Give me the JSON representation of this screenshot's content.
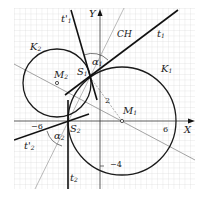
{
  "diagram": {
    "axes": {
      "x_label": "X",
      "y_label": "Y",
      "tick_labels": {
        "x_neg": "−6",
        "x_pos": "6",
        "y_neg": "−4",
        "y_pos": "2"
      }
    },
    "circles": [
      {
        "id": "K1",
        "label": "K",
        "sub": "1",
        "center_label": "M",
        "center_sub": "1"
      },
      {
        "id": "K2",
        "label": "K",
        "sub": "2",
        "center_label": "M",
        "center_sub": "2"
      }
    ],
    "points": [
      {
        "label": "S",
        "sub": "1"
      },
      {
        "label": "S",
        "sub": "2"
      }
    ],
    "lines": {
      "t1": {
        "label": "t",
        "sub": "1"
      },
      "t1p": {
        "label": "t'",
        "sub": "1"
      },
      "t2": {
        "label": "t",
        "sub": "2"
      },
      "t2p": {
        "label": "t'",
        "sub": "2"
      },
      "ch": {
        "label": "CH"
      }
    },
    "angles": [
      {
        "label": "α",
        "sub": "1"
      },
      {
        "label": "α",
        "sub": "2"
      }
    ],
    "colors": {
      "grid": "#c8c8c8",
      "stroke": "#1a1a1a",
      "thin": "#555555"
    }
  }
}
